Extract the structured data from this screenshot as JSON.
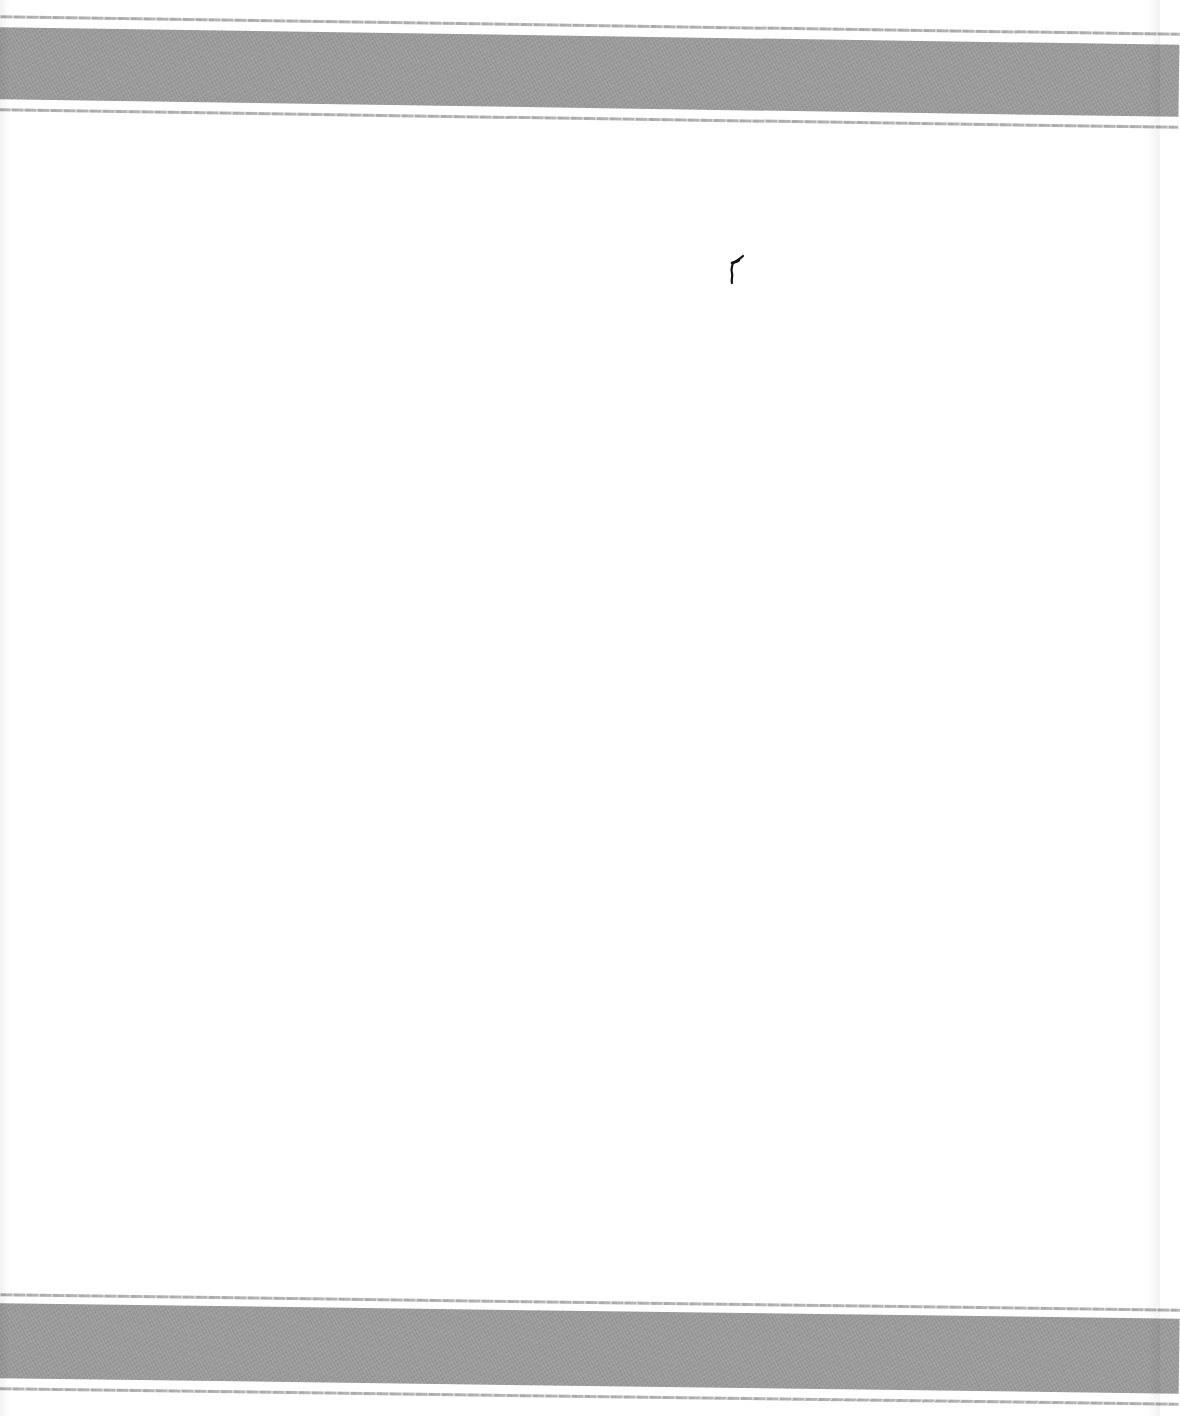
{
  "scene": {
    "description": "White textile (tea towel) with gray woven stripe bands at top and bottom",
    "background_color": "#ffffff",
    "stripe_color": "#9a9a9a",
    "pinstripe_color": "#a8a8a8",
    "mark_color": "#111111"
  },
  "stripes": [
    {
      "position": "top",
      "pin_top_y": 15,
      "band_top_y": 27,
      "band_height": 72,
      "pin_bottom_y": 108,
      "slope_deg": 0.85
    },
    {
      "position": "bottom",
      "pin_top_y": 1293,
      "band_top_y": 1303,
      "band_height": 75,
      "pin_bottom_y": 1387,
      "slope_deg": 0.75
    }
  ],
  "mark": {
    "x": 726,
    "y": 254,
    "width": 22,
    "height": 32
  }
}
